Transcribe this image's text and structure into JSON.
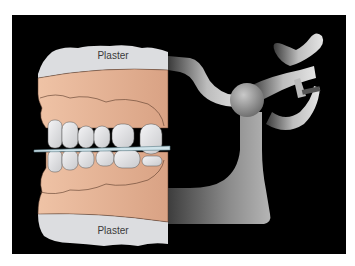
{
  "figure": {
    "labels": {
      "top_plaster": "Plaster",
      "bottom_plaster": "Plaster"
    },
    "colors": {
      "background": "#ffffff",
      "panel": "#000000",
      "plaster": "#dcdde0",
      "gum": "#e9b899",
      "tooth": "#e6e7ea",
      "metal_light": "#cfcfcf",
      "metal_dark": "#5a5a5a"
    }
  }
}
